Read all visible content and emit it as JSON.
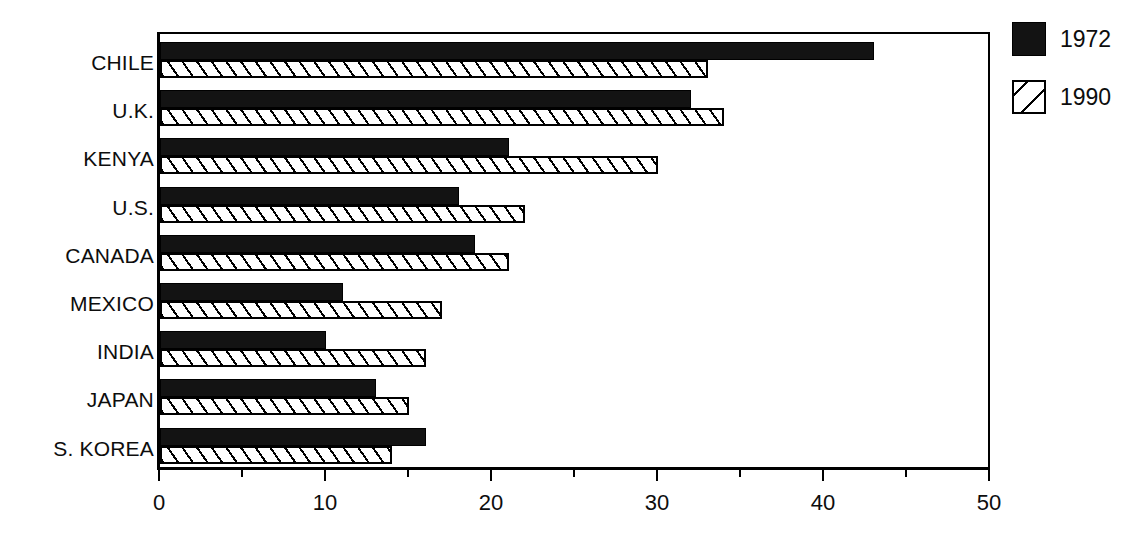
{
  "chart_data": {
    "type": "bar",
    "orientation": "horizontal",
    "title": "",
    "subtitle": "",
    "xlabel": "",
    "ylabel": "",
    "xlim": [
      0,
      50
    ],
    "xticks": [
      0,
      10,
      20,
      30,
      40,
      50
    ],
    "xtick_labels": [
      "0",
      "10",
      "20",
      "30",
      "40",
      "50"
    ],
    "minor_tick_interval": 5,
    "grid": false,
    "legend_position": "right-top",
    "categories": [
      "CHILE",
      "U.K.",
      "KENYA",
      "U.S.",
      "CANADA",
      "MEXICO",
      "INDIA",
      "JAPAN",
      "S. KOREA"
    ],
    "series": [
      {
        "name": "1972",
        "style": "solid-black",
        "color": "#131313",
        "values": [
          43,
          32,
          21,
          18,
          19,
          11,
          10,
          13,
          16
        ]
      },
      {
        "name": "1990",
        "style": "diagonal-hatch",
        "color": "#ffffff",
        "values": [
          33,
          34,
          30,
          22,
          21,
          17,
          16,
          15,
          14
        ]
      }
    ]
  },
  "legend": {
    "items": [
      {
        "label": "1972",
        "swatch": "solid-black-swatch"
      },
      {
        "label": "1990",
        "swatch": "hatched-swatch"
      }
    ]
  },
  "axis": {
    "x_tick_labels": [
      "0",
      "10",
      "20",
      "30",
      "40",
      "50"
    ]
  },
  "colors": {
    "bar_1972": "#131313",
    "bar_1990_fill": "#ffffff",
    "outline": "#000000",
    "text": "#0d0d0d",
    "background": "#ffffff"
  }
}
